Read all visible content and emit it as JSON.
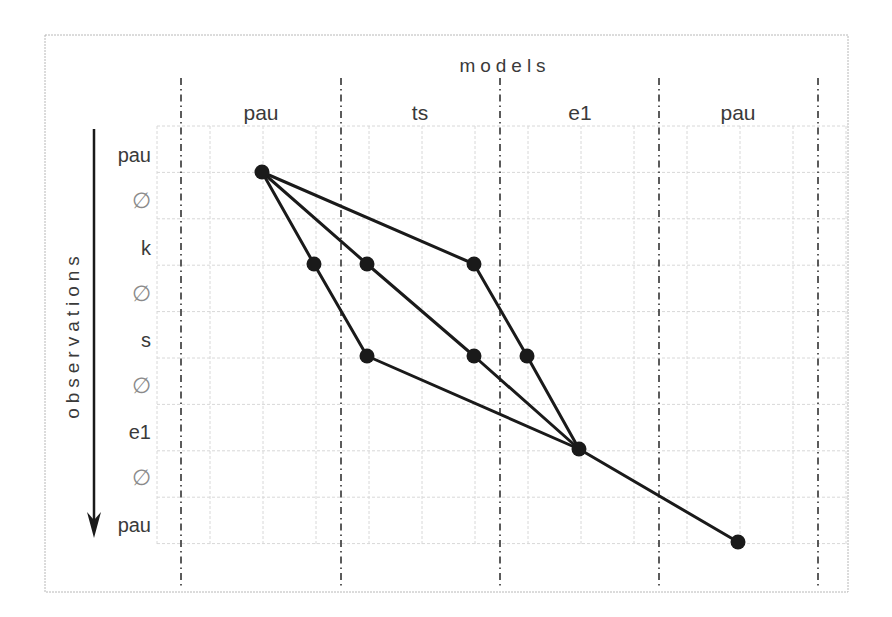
{
  "diagram": {
    "x_axis_title": "models",
    "y_axis_title": "observations",
    "columns": [
      {
        "label": "pau",
        "x": 261
      },
      {
        "label": "ts",
        "x": 420
      },
      {
        "label": "e1",
        "x": 580
      },
      {
        "label": "pau",
        "x": 738
      }
    ],
    "rows": [
      {
        "label": "pau",
        "y": 155,
        "empty": false
      },
      {
        "label": "∅",
        "y": 201,
        "empty": true
      },
      {
        "label": "k",
        "y": 248,
        "empty": false
      },
      {
        "label": "∅",
        "y": 294,
        "empty": true
      },
      {
        "label": "s",
        "y": 340,
        "empty": false
      },
      {
        "label": "∅",
        "y": 386,
        "empty": true
      },
      {
        "label": "e1",
        "y": 432,
        "empty": false
      },
      {
        "label": "∅",
        "y": 478,
        "empty": true
      },
      {
        "label": "pau",
        "y": 525,
        "empty": false
      }
    ],
    "separators_x": [
      181,
      341,
      500,
      659,
      818
    ],
    "nodes": [
      {
        "id": "n0",
        "x": 262,
        "y": 172
      },
      {
        "id": "n1",
        "x": 314,
        "y": 264
      },
      {
        "id": "n2",
        "x": 367,
        "y": 264
      },
      {
        "id": "n3",
        "x": 474,
        "y": 264
      },
      {
        "id": "n4",
        "x": 367,
        "y": 356
      },
      {
        "id": "n5",
        "x": 474,
        "y": 356
      },
      {
        "id": "n6",
        "x": 527,
        "y": 356
      },
      {
        "id": "n7",
        "x": 579,
        "y": 449
      },
      {
        "id": "n8",
        "x": 738,
        "y": 542
      }
    ],
    "edges": [
      [
        "n0",
        "n1"
      ],
      [
        "n0",
        "n2"
      ],
      [
        "n0",
        "n3"
      ],
      [
        "n1",
        "n4"
      ],
      [
        "n2",
        "n5"
      ],
      [
        "n3",
        "n6"
      ],
      [
        "n4",
        "n7"
      ],
      [
        "n5",
        "n7"
      ],
      [
        "n6",
        "n7"
      ],
      [
        "n7",
        "n8"
      ]
    ],
    "colors": {
      "line": "#1a1a1a",
      "grid": "#d8d8d8",
      "separator": "#333333",
      "frame": "#b0b0b0"
    }
  }
}
